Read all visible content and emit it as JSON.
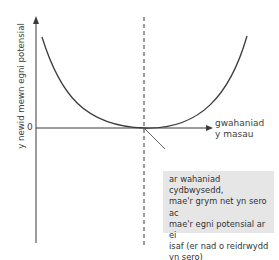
{
  "diagram": {
    "type": "potential-energy-curve",
    "y_axis_label": "y newid mewn egni potensial",
    "origin_label": "0",
    "x_axis_label": "gwahaniad\ny masau",
    "annotation": "ar wahaniad cydbwysedd,\nmae'r grym net yn sero ac\nmae'r egni potensial ar ei\nisaf (er nad o reidrwydd\nyn sero)",
    "colors": {
      "line": "#3a3a3a",
      "annotation_background": "#e6e6e6"
    }
  }
}
